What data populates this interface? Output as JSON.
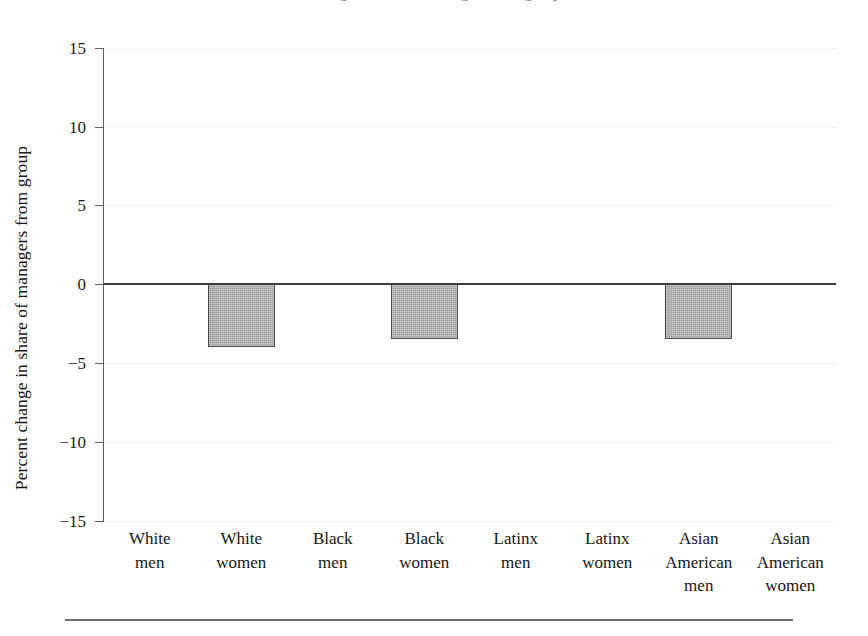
{
  "figure": {
    "title_partial": "Change in share of managers from group",
    "bottom_rule": "horizontal-rule"
  },
  "axes": {
    "y_axis_title": "Percent change in share of managers from group",
    "y_ticks": [
      "15",
      "10",
      "5",
      "0",
      "−5",
      "−10",
      "−15"
    ],
    "zero_label": "0"
  },
  "chart_data": {
    "type": "bar",
    "title": "Change in share of managers from group",
    "xlabel": "",
    "ylabel": "Percent change in share of managers from group",
    "ylim": [
      -15,
      15
    ],
    "yticks": [
      15,
      10,
      5,
      0,
      -5,
      -10,
      -15
    ],
    "ytick_labels": [
      "15",
      "10",
      "5",
      "0",
      "−5",
      "−10",
      "−15"
    ],
    "grid": false,
    "legend": "none",
    "orientation": "vertical",
    "baseline": 0,
    "categories": [
      "White men",
      "White women",
      "Black men",
      "Black women",
      "Latinx men",
      "Latinx women",
      "Asian American men",
      "Asian American women"
    ],
    "category_lines": [
      [
        "White",
        "men"
      ],
      [
        "White",
        "women"
      ],
      [
        "Black",
        "men"
      ],
      [
        "Black",
        "women"
      ],
      [
        "Latinx",
        "men"
      ],
      [
        "Latinx",
        "women"
      ],
      [
        "Asian",
        "American",
        "men"
      ],
      [
        "Asian",
        "American",
        "women"
      ]
    ],
    "values": [
      0,
      -4.0,
      0,
      -3.5,
      0,
      0,
      -3.5,
      0
    ],
    "bar_color": "#a9a9a9",
    "bar_edge_color": "#4e4e4e",
    "bars": [
      {
        "category": "White men",
        "value": 0
      },
      {
        "category": "White women",
        "value": -4.0
      },
      {
        "category": "Black men",
        "value": 0
      },
      {
        "category": "Black women",
        "value": -3.5
      },
      {
        "category": "Latinx men",
        "value": 0
      },
      {
        "category": "Latinx women",
        "value": 0
      },
      {
        "category": "Asian American men",
        "value": -3.5
      },
      {
        "category": "Asian American women",
        "value": 0
      }
    ]
  }
}
